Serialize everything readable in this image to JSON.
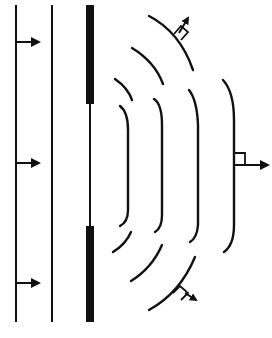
{
  "diagram": {
    "title": "",
    "colors": {
      "ink": "#111111",
      "background": "#ffffff"
    },
    "incident_wavefronts": [
      {
        "x": 16
      },
      {
        "x": 52
      }
    ],
    "incident_arrows": [
      {
        "y": 42
      },
      {
        "y": 163
      },
      {
        "y": 283
      }
    ],
    "barrier": {
      "x": 90,
      "upper_block": [
        5,
        104
      ],
      "lower_block": [
        226,
        322
      ],
      "slit_label": ""
    },
    "diffracted_wavefronts_count": 4,
    "propagation_arrows": [
      {
        "name": "up-right",
        "label": ""
      },
      {
        "name": "right",
        "label": ""
      },
      {
        "name": "down-right",
        "label": ""
      }
    ]
  }
}
